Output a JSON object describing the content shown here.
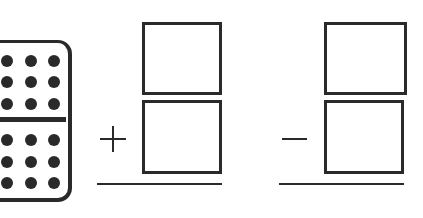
{
  "worksheet": {
    "type": "domino-fact-family",
    "domino": {
      "top_pips": 9,
      "bottom_pips": 9,
      "pip_color": "#2a2a2a"
    },
    "problems": [
      {
        "operator": "+",
        "operator_name": "plus",
        "answer_boxes": 2,
        "top_box_value": "",
        "bottom_box_value": "",
        "result_value": ""
      },
      {
        "operator": "−",
        "operator_name": "minus",
        "answer_boxes": 2,
        "top_box_value": "",
        "bottom_box_value": "",
        "result_value": ""
      }
    ],
    "ink_color": "#2a2a2a",
    "background": "#ffffff"
  }
}
